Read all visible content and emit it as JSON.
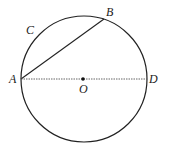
{
  "diagram": {
    "type": "circle-geometry",
    "labels": {
      "A": "A",
      "B": "B",
      "C": "C",
      "D": "D",
      "O": "O"
    },
    "elements": [
      {
        "kind": "circle",
        "center": "O",
        "through": [
          "A",
          "B",
          "D"
        ]
      },
      {
        "kind": "chord",
        "from": "A",
        "to": "B",
        "style": "solid"
      },
      {
        "kind": "diameter",
        "from": "A",
        "to": "D",
        "style": "dashed"
      },
      {
        "kind": "point",
        "name": "O",
        "marked": true
      },
      {
        "kind": "arc-label",
        "name": "C",
        "arc": "AB"
      }
    ],
    "colors": {
      "stroke": "#222222",
      "dashed": "#555555"
    }
  }
}
